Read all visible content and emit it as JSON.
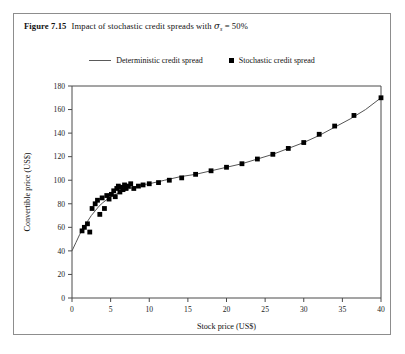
{
  "figure": {
    "number": "Figure 7.15",
    "caption_text": "Impact of stochastic credit spreads with",
    "symbol": "σ",
    "symbol_subscript": "s",
    "caption_tail": "= 50%"
  },
  "legend": {
    "position": "top-center",
    "entries": [
      {
        "label": "Deterministic credit spread",
        "marker": "line",
        "color": "#555555"
      },
      {
        "label": "Stochastic credit spread",
        "marker": "square",
        "color": "#000000"
      }
    ]
  },
  "chart_data": {
    "type": "scatter",
    "title": "Impact of stochastic credit spreads with σs = 50%",
    "xlabel": "Stock price (US$)",
    "ylabel": "Convertible price (US$)",
    "xlim": [
      0,
      40
    ],
    "ylim": [
      0,
      180
    ],
    "xticks": [
      0,
      5,
      10,
      15,
      20,
      25,
      30,
      35,
      40
    ],
    "yticks": [
      0,
      20,
      40,
      60,
      80,
      100,
      120,
      140,
      160,
      180
    ],
    "grid": false,
    "series": [
      {
        "name": "Deterministic credit spread",
        "type": "line",
        "color": "#555555",
        "x": [
          0,
          0.5,
          1,
          1.5,
          2,
          2.5,
          3,
          3.5,
          4,
          5,
          6,
          7,
          8,
          9,
          10,
          12,
          14,
          16,
          18,
          20,
          22,
          24,
          26,
          28,
          30,
          32,
          34,
          36,
          38,
          40
        ],
        "y": [
          40,
          47,
          54,
          60,
          65,
          70,
          74,
          78,
          81,
          86,
          89,
          92,
          94,
          96,
          97,
          100,
          103,
          105,
          108,
          111,
          114,
          118,
          122,
          127,
          132,
          138,
          145,
          152,
          160,
          170
        ]
      },
      {
        "name": "Stochastic credit spread",
        "type": "scatter",
        "color": "#000000",
        "x": [
          1.3,
          1.6,
          2.0,
          2.3,
          2.6,
          3.0,
          3.3,
          3.6,
          3.9,
          4.2,
          4.5,
          4.8,
          5.1,
          5.4,
          5.6,
          5.8,
          6.0,
          6.2,
          6.4,
          6.6,
          6.8,
          7.0,
          7.3,
          7.6,
          8.0,
          8.6,
          9.2,
          10.0,
          11.2,
          12.6,
          14.2,
          16.0,
          18.0,
          20.0,
          22.0,
          24.0,
          26.0,
          28.0,
          30.0,
          32.0,
          34.0,
          36.5,
          40.0
        ],
        "y": [
          57,
          60,
          63,
          56,
          76,
          80,
          83,
          71,
          85,
          76,
          87,
          84,
          88,
          91,
          86,
          93,
          95,
          90,
          94,
          92,
          96,
          93,
          95,
          97,
          93,
          95,
          96,
          97,
          98,
          100,
          102,
          105,
          108,
          111,
          114,
          118,
          122,
          127,
          132,
          139,
          146,
          155,
          170
        ]
      }
    ]
  }
}
